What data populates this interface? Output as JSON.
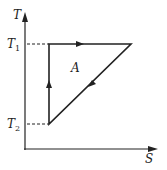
{
  "diagram": {
    "type": "T-S cycle diagram",
    "y_axis_label": "T",
    "x_axis_label": "S",
    "levels": [
      {
        "name": "T",
        "sub": "1"
      },
      {
        "name": "T",
        "sub": "2"
      }
    ],
    "region_label": "A",
    "colors": {
      "line": "#222222",
      "dash": "#444444"
    }
  }
}
